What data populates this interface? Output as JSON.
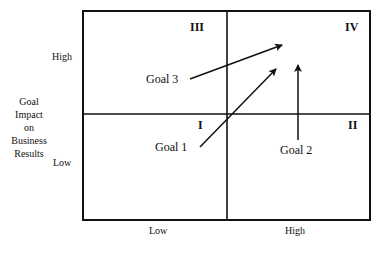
{
  "diagram": {
    "y_axis": {
      "title_lines": [
        "Goal",
        "Impact",
        "on",
        "Business",
        "Results"
      ],
      "high_label": "High",
      "low_label": "Low"
    },
    "x_axis": {
      "low_label": "Low",
      "high_label": "High"
    },
    "quadrants": {
      "top_left": "III",
      "top_right": "IV",
      "bottom_left": "I",
      "bottom_right": "II"
    },
    "goals": [
      {
        "label": "Goal 1",
        "from_quadrant": "I",
        "to_quadrant": "IV"
      },
      {
        "label": "Goal 2",
        "from_quadrant": "II",
        "to_quadrant": "IV"
      },
      {
        "label": "Goal 3",
        "from_quadrant": "III",
        "to_quadrant": "IV"
      }
    ],
    "line_color": "#111111"
  }
}
